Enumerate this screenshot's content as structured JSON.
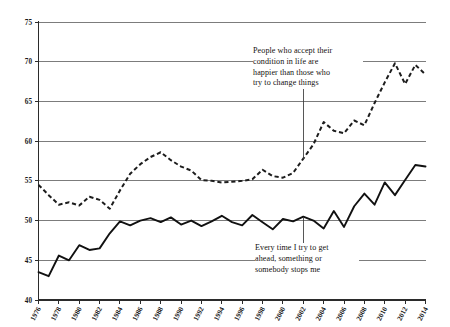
{
  "chart_data": {
    "type": "line",
    "title": "",
    "subtitle": "",
    "xlabel": "",
    "ylabel": "",
    "xlim": [
      1976,
      2014
    ],
    "ylim": [
      40,
      75
    ],
    "y_ticks": [
      40,
      45,
      50,
      55,
      60,
      65,
      70,
      75
    ],
    "x_ticks": [
      1976,
      1978,
      1980,
      1982,
      1984,
      1986,
      1988,
      1990,
      1992,
      1994,
      1996,
      1998,
      2000,
      2002,
      2004,
      2006,
      2008,
      2010,
      2012,
      2014
    ],
    "x_tick_labels": [
      "1976",
      "1978",
      "1980",
      "1982",
      "1984",
      "1986",
      "1988",
      "1990",
      "1992",
      "1994",
      "1996",
      "1998",
      "2000",
      "2002",
      "2004",
      "2006",
      "2008",
      "2010",
      "2012",
      "2014"
    ],
    "y_tick_labels": [
      "40",
      "45",
      "50",
      "55",
      "60",
      "65",
      "70",
      "75"
    ],
    "grid": true,
    "grid_axis": "y",
    "legend": false,
    "legend_position": "none",
    "x": [
      1976,
      1977,
      1978,
      1979,
      1980,
      1981,
      1982,
      1983,
      1984,
      1985,
      1986,
      1987,
      1988,
      1989,
      1990,
      1991,
      1992,
      1993,
      1994,
      1995,
      1996,
      1997,
      1998,
      1999,
      2000,
      2001,
      2002,
      2003,
      2004,
      2005,
      2006,
      2007,
      2008,
      2009,
      2010,
      2011,
      2012,
      2013,
      2014
    ],
    "series": [
      {
        "name": "People who accept their condition in life are happier than those who try to change things",
        "style": "dashed",
        "color": "#1d1d1d",
        "values": [
          54.5,
          53.2,
          52.0,
          52.3,
          51.9,
          53.0,
          52.6,
          51.5,
          53.8,
          55.9,
          57.1,
          58.0,
          58.6,
          57.6,
          56.8,
          56.3,
          55.1,
          55.0,
          54.8,
          54.9,
          55.0,
          55.2,
          56.4,
          55.6,
          55.4,
          56.0,
          57.8,
          59.6,
          62.4,
          61.3,
          61.0,
          62.6,
          62.0,
          64.8,
          67.4,
          69.8,
          67.2,
          69.6,
          68.4
        ]
      },
      {
        "name": "Every time I try to get ahead, something or somebody stops me",
        "style": "solid",
        "color": "#111111",
        "values": [
          43.5,
          43.0,
          45.6,
          45.0,
          46.9,
          46.3,
          46.5,
          48.4,
          49.9,
          49.4,
          50.0,
          50.3,
          49.8,
          50.4,
          49.5,
          50.0,
          49.3,
          49.9,
          50.6,
          49.8,
          49.4,
          50.7,
          49.8,
          48.9,
          50.2,
          49.9,
          50.5,
          50.0,
          49.0,
          51.2,
          49.2,
          51.8,
          53.4,
          52.0,
          54.8,
          53.2,
          55.1,
          57.0,
          56.8
        ]
      }
    ],
    "annotations": [
      {
        "id": "accept",
        "text": "People who accept their\ncondition in life are\nhappier than those who\ntry to change things",
        "anchor_year": 2002,
        "anchor_value": 57.8
      },
      {
        "id": "ahead",
        "text": "Every time I try to get\nahead, something or\nsomebody stops me",
        "anchor_year": 2002,
        "anchor_value": 50.5
      }
    ],
    "colors": {
      "background": "#ffffff",
      "grid": "#6e6e6e",
      "axis": "#2b2b2b",
      "text": "#1a1a1a"
    }
  }
}
